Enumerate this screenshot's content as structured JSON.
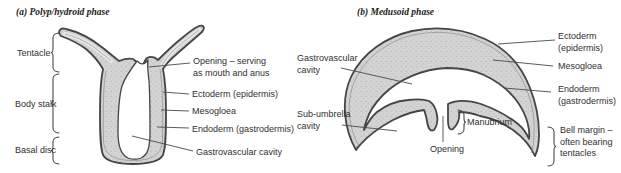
{
  "panel_a": {
    "title": "(a) Polyp/hydroid phase",
    "left_labels": {
      "tentacle": "Tentacle",
      "body_stalk": "Body stalk",
      "basal_disc": "Basal disc"
    },
    "right_labels": {
      "opening": [
        "Opening – serving",
        "as mouth and anus"
      ],
      "ectoderm": "Ectoderm (epidermis)",
      "mesogloea": "Mesogloea",
      "endoderm": "Endoderm (gastrodermis)",
      "gastrovascular": "Gastrovascular cavity"
    }
  },
  "panel_b": {
    "title": "(b) Medusoid phase",
    "labels": {
      "gastrovascular": [
        "Gastrovascular",
        "cavity"
      ],
      "sub_umbrella": [
        "Sub-umbrella",
        "cavity"
      ],
      "ectoderm": [
        "Ectoderm",
        "(epidermis)"
      ],
      "mesogloea": "Mesogloea",
      "endoderm": [
        "Endoderm",
        "(gastrodermis)"
      ],
      "bell_margin": [
        "Bell margin –",
        "often bearing",
        "tentacles"
      ],
      "manubrium": "Manubrium",
      "opening": "Opening"
    }
  },
  "colors": {
    "body_fill": "#d3d3d3",
    "stipple_dot": "#b2b2b2",
    "outline": "#454545",
    "leader_line": "#4a4a4a",
    "text": "#2f2f2f"
  }
}
